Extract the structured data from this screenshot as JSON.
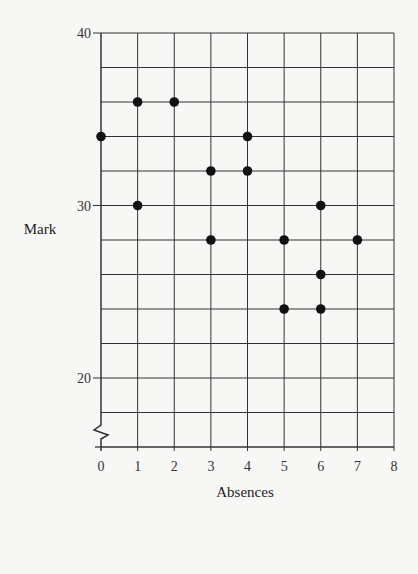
{
  "chart_data": {
    "type": "scatter",
    "title": "",
    "xlabel": "Absences",
    "ylabel": "Mark",
    "xlim": [
      0,
      8
    ],
    "ylim": [
      16,
      40
    ],
    "y_axis_break": true,
    "grid": true,
    "x_ticks": [
      0,
      1,
      2,
      3,
      4,
      5,
      6,
      7,
      8
    ],
    "y_tick_labels": [
      20,
      30,
      40
    ],
    "y_grid_step": 2,
    "series": [
      {
        "name": "students",
        "points": [
          {
            "x": 0,
            "y": 34
          },
          {
            "x": 1,
            "y": 36
          },
          {
            "x": 2,
            "y": 36
          },
          {
            "x": 1,
            "y": 30
          },
          {
            "x": 3,
            "y": 32
          },
          {
            "x": 4,
            "y": 34
          },
          {
            "x": 4,
            "y": 32
          },
          {
            "x": 3,
            "y": 28
          },
          {
            "x": 5,
            "y": 28
          },
          {
            "x": 6,
            "y": 30
          },
          {
            "x": 7,
            "y": 28
          },
          {
            "x": 6,
            "y": 26
          },
          {
            "x": 5,
            "y": 24
          },
          {
            "x": 6,
            "y": 24
          }
        ]
      }
    ],
    "colors": {
      "point": "#111111",
      "grid": "#333333",
      "background": "#f7f7f5"
    }
  }
}
